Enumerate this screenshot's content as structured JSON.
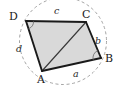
{
  "figure": {
    "width": 122,
    "height": 89,
    "background": "#ffffff",
    "colors": {
      "fill": "#d9d9d9",
      "stroke": "#1a1a1a",
      "circle_dashed": "#9a9a9a",
      "diagonal": "#333333",
      "label_text": "#1a1a1a"
    },
    "circle": {
      "cx": 63,
      "cy": 41,
      "r": 43.5,
      "style": "dashed"
    },
    "vertices": [
      {
        "id": "A",
        "label": "A",
        "x": 42,
        "y": 71,
        "label_x": 37,
        "label_y": 73
      },
      {
        "id": "B",
        "label": "B",
        "x": 101,
        "y": 58,
        "label_x": 105,
        "label_y": 54
      },
      {
        "id": "C",
        "label": "C",
        "x": 86,
        "y": 22,
        "label_x": 82,
        "label_y": 10
      },
      {
        "id": "D",
        "label": "D",
        "x": 26,
        "y": 21,
        "label_x": 11,
        "label_y": 12
      }
    ],
    "sides": [
      {
        "id": "a",
        "label": "a",
        "from": "A",
        "to": "B",
        "label_x": 74,
        "label_y": 70
      },
      {
        "id": "b",
        "label": "b",
        "from": "B",
        "to": "C",
        "label_x": 96,
        "label_y": 37
      },
      {
        "id": "c",
        "label": "c",
        "from": "C",
        "to": "D",
        "label_x": 55,
        "label_y": 7
      },
      {
        "id": "d",
        "label": "d",
        "from": "D",
        "to": "A",
        "label_x": 17,
        "label_y": 45
      }
    ],
    "diagonal": {
      "from": "A",
      "to": "C"
    },
    "angle_marks": [
      {
        "at": "D"
      },
      {
        "at": "B"
      }
    ]
  }
}
